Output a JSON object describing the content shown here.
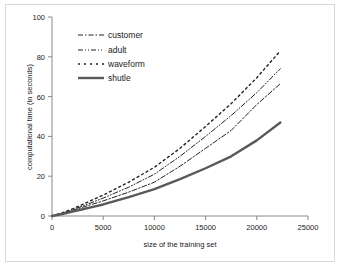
{
  "chart_data": {
    "type": "line",
    "title": "",
    "xlabel": "size of the training set",
    "ylabel": "computational time (in seconds)",
    "xlim": [
      0,
      25000
    ],
    "ylim": [
      0,
      100
    ],
    "xticks": [
      "0",
      "5000",
      "10000",
      "15000",
      "20000",
      "25000"
    ],
    "xtick_values": [
      0,
      5000,
      10000,
      15000,
      20000,
      25000
    ],
    "yticks": [
      "0",
      "20",
      "40",
      "60",
      "80",
      "100"
    ],
    "ytick_values": [
      0,
      20,
      40,
      60,
      80,
      100
    ],
    "grid": false,
    "legend_position": "upper-left-inside",
    "x": [
      0,
      1000,
      2000,
      3000,
      4000,
      5000,
      7500,
      10000,
      12500,
      15000,
      17500,
      20000,
      22300
    ],
    "series": [
      {
        "name": "customer",
        "style": "dash-dot",
        "color": "#222222",
        "values": [
          0,
          1.2,
          2.8,
          4.4,
          6.0,
          7.6,
          12.0,
          17.0,
          25.0,
          34.0,
          43.0,
          56.0,
          66.5
        ]
      },
      {
        "name": "adult",
        "style": "dash-dot-dot",
        "color": "#222222",
        "values": [
          0,
          1.4,
          3.1,
          5.0,
          7.0,
          9.0,
          14.5,
          21.0,
          30.0,
          40.0,
          50.5,
          62.0,
          74.0
        ]
      },
      {
        "name": "waveform",
        "style": "dotted",
        "color": "#222222",
        "values": [
          0,
          1.6,
          3.6,
          5.8,
          8.2,
          10.5,
          17.0,
          24.5,
          34.0,
          45.0,
          56.5,
          69.5,
          83.0
        ]
      },
      {
        "name": "shutle",
        "style": "solid",
        "color": "#595959",
        "values": [
          0,
          1.0,
          2.2,
          3.4,
          4.6,
          5.8,
          9.5,
          13.5,
          18.5,
          24.0,
          30.0,
          38.0,
          47.0
        ]
      }
    ]
  },
  "legend": {
    "items": [
      {
        "label": "customer"
      },
      {
        "label": "adult"
      },
      {
        "label": "waveform"
      },
      {
        "label": "shutle"
      }
    ]
  },
  "axes": {
    "x_title": "size of the training set",
    "y_title": "computational time (in seconds)"
  }
}
